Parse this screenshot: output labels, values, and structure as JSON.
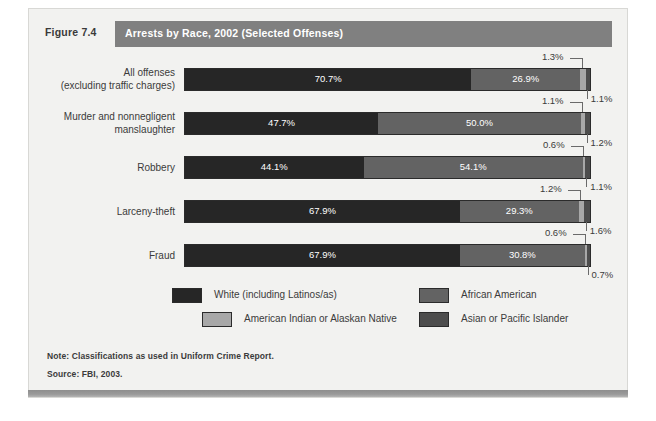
{
  "figure": {
    "number": "Figure 7.4",
    "title": "Arrests by Race, 2002 (Selected Offenses)",
    "note": "Note: Classifications as used in Uniform Crime Report.",
    "source": "Source: FBI, 2003."
  },
  "colors": {
    "white_cat": "#262626",
    "african_american": "#636363",
    "american_indian": "#a8a8a8",
    "asian_pacific": "#4d4d4d",
    "title_band": "#808080",
    "panel_bg": "#f2f2f0",
    "text": "#3b3b3b"
  },
  "legend": {
    "items": [
      {
        "label": "White (including Latinos/as)",
        "color": "#262626"
      },
      {
        "label": "African American",
        "color": "#636363"
      },
      {
        "label": "American Indian or Alaskan Native",
        "color": "#a8a8a8"
      },
      {
        "label": "Asian or Pacific Islander",
        "color": "#4d4d4d"
      }
    ]
  },
  "chart_data": {
    "type": "bar",
    "orientation": "horizontal",
    "stacked": true,
    "units": "percent",
    "title": "Arrests by Race, 2002 (Selected Offenses)",
    "xlabel": "",
    "ylabel": "",
    "xlim": [
      0,
      100
    ],
    "grid": false,
    "legend_position": "bottom",
    "series": [
      {
        "name": "White (including Latinos/as)",
        "color": "#262626",
        "values": [
          70.7,
          47.7,
          44.1,
          67.9,
          67.9
        ]
      },
      {
        "name": "African American",
        "color": "#636363",
        "values": [
          26.9,
          50.0,
          54.1,
          29.3,
          30.8
        ]
      },
      {
        "name": "American Indian or Alaskan Native",
        "color": "#a8a8a8",
        "values": [
          1.3,
          1.1,
          0.6,
          1.2,
          0.6
        ]
      },
      {
        "name": "Asian or Pacific Islander",
        "color": "#4d4d4d",
        "values": [
          1.1,
          1.2,
          1.1,
          1.6,
          0.7
        ]
      }
    ],
    "categories": [
      "All offenses (excluding traffic charges)",
      "Murder and nonnegligent manslaughter",
      "Robbery",
      "Larceny-theft",
      "Fraud"
    ],
    "rows": [
      {
        "label_line1": "All offenses",
        "label_line2": "(excluding traffic charges)",
        "white": "70.7%",
        "african_american": "26.9%",
        "american_indian": "1.3%",
        "asian_pacific": "1.1%"
      },
      {
        "label_line1": "Murder and nonnegligent",
        "label_line2": "manslaughter",
        "white": "47.7%",
        "african_american": "50.0%",
        "american_indian": "1.1%",
        "asian_pacific": "1.2%"
      },
      {
        "label_line1": "Robbery",
        "label_line2": "",
        "white": "44.1%",
        "african_american": "54.1%",
        "american_indian": "0.6%",
        "asian_pacific": "1.1%"
      },
      {
        "label_line1": "Larceny-theft",
        "label_line2": "",
        "white": "67.9%",
        "african_american": "29.3%",
        "american_indian": "1.2%",
        "asian_pacific": "1.6%"
      },
      {
        "label_line1": "Fraud",
        "label_line2": "",
        "white": "67.9%",
        "african_american": "30.8%",
        "american_indian": "0.6%",
        "asian_pacific": "0.7%"
      }
    ]
  }
}
